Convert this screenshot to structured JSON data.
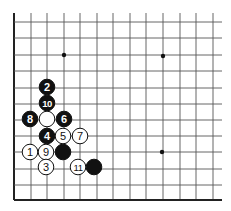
{
  "diagram": {
    "type": "go-board-corner",
    "grid": {
      "columns_x": [
        14,
        31,
        47,
        64,
        80,
        97,
        113,
        130,
        146,
        163,
        180,
        196,
        213
      ],
      "rows_y": [
        22,
        38,
        55,
        71,
        88,
        104,
        120,
        136,
        152,
        169,
        185,
        200
      ],
      "right_extent": 222,
      "top_extent": 13,
      "line_color": "#555555",
      "edge_color": "#222222"
    },
    "star_points": [
      {
        "x": 64,
        "y": 55
      },
      {
        "x": 163,
        "y": 56
      },
      {
        "x": 162,
        "y": 152
      }
    ],
    "stones": [
      {
        "color": "black",
        "label": "2",
        "x": 47,
        "y": 87
      },
      {
        "color": "black",
        "label": "10",
        "x": 47,
        "y": 103
      },
      {
        "color": "black",
        "label": "8",
        "x": 30,
        "y": 119
      },
      {
        "color": "white",
        "label": "",
        "x": 47,
        "y": 119
      },
      {
        "color": "black",
        "label": "6",
        "x": 64,
        "y": 119
      },
      {
        "color": "black",
        "label": "4",
        "x": 47,
        "y": 136
      },
      {
        "color": "white",
        "label": "5",
        "x": 63,
        "y": 136
      },
      {
        "color": "white",
        "label": "7",
        "x": 80,
        "y": 136
      },
      {
        "color": "white",
        "label": "1",
        "x": 30,
        "y": 152
      },
      {
        "color": "white",
        "label": "9",
        "x": 46,
        "y": 152
      },
      {
        "color": "black",
        "label": "",
        "x": 63,
        "y": 152
      },
      {
        "color": "white",
        "label": "3",
        "x": 46,
        "y": 167
      },
      {
        "color": "white",
        "label": "11",
        "x": 78,
        "y": 167
      },
      {
        "color": "black",
        "label": "",
        "x": 94,
        "y": 167
      }
    ]
  }
}
